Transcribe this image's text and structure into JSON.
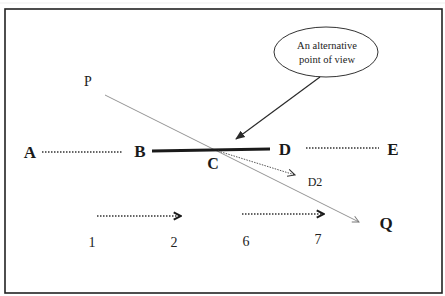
{
  "diagram": {
    "callout": {
      "line1": "An alternative",
      "line2": "point of view"
    },
    "labels": {
      "P": "P",
      "Q": "Q",
      "A": "A",
      "B": "B",
      "C": "C",
      "D": "D",
      "E": "E",
      "D2": "D2",
      "n1": "1",
      "n2": "2",
      "n6": "6",
      "n7": "7"
    },
    "colors": {
      "ink": "#1a1a1a",
      "thin_line": "#777777",
      "frame": "#222222",
      "background": "#ffffff"
    }
  }
}
